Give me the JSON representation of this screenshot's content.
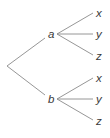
{
  "diagram": {
    "type": "tree",
    "root": {
      "x": 7,
      "y": 66
    },
    "branches": [
      {
        "label": "a",
        "label_pos": {
          "x": 48,
          "y": 38
        },
        "vertex": {
          "x": 57,
          "y": 34
        },
        "leaves": [
          {
            "label": "x",
            "end": {
              "x": 93,
              "y": 13
            },
            "label_pos": {
              "x": 96,
              "y": 17
            }
          },
          {
            "label": "y",
            "end": {
              "x": 93,
              "y": 34
            },
            "label_pos": {
              "x": 96,
              "y": 38
            }
          },
          {
            "label": "z",
            "end": {
              "x": 93,
              "y": 55
            },
            "label_pos": {
              "x": 96,
              "y": 60
            }
          }
        ]
      },
      {
        "label": "b",
        "label_pos": {
          "x": 48,
          "y": 102
        },
        "vertex": {
          "x": 57,
          "y": 99
        },
        "leaves": [
          {
            "label": "x",
            "end": {
              "x": 93,
              "y": 78
            },
            "label_pos": {
              "x": 96,
              "y": 82
            }
          },
          {
            "label": "y",
            "end": {
              "x": 93,
              "y": 99
            },
            "label_pos": {
              "x": 96,
              "y": 103
            }
          },
          {
            "label": "z",
            "end": {
              "x": 93,
              "y": 120
            },
            "label_pos": {
              "x": 96,
              "y": 125
            }
          }
        ]
      }
    ],
    "colors": {
      "edge": "#8a8a8a",
      "text": "#3a3a3a",
      "background": "#ffffff"
    }
  }
}
